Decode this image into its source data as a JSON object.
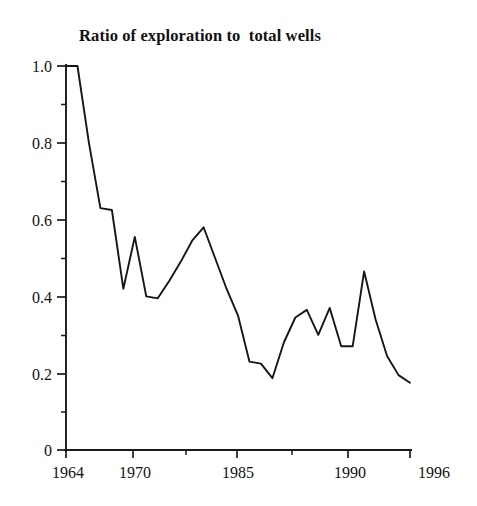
{
  "chart_data": {
    "type": "line",
    "title": "Ratio of exploration to  total wells",
    "xlabel": "",
    "ylabel": "",
    "grid": false,
    "legend": null,
    "xlim": [
      1963,
      1996
    ],
    "ylim": [
      0,
      1.0
    ],
    "y_ticks": [
      "0",
      "0.2",
      "0.4",
      "0.6",
      "0.8",
      "1.0"
    ],
    "y_tick_values": [
      0,
      0.2,
      0.4,
      0.6,
      0.8,
      1.0
    ],
    "y_minor_ticks": [
      0.1,
      0.3,
      0.5,
      0.7,
      0.9
    ],
    "x_ticks": [
      "1964",
      "1970",
      "1985",
      "1990",
      "1996"
    ],
    "x_tick_values": [
      1964,
      1970,
      1985,
      1990,
      1996
    ],
    "x": [
      1963,
      1964,
      1965,
      1966,
      1967,
      1968,
      1969,
      1970,
      1971,
      1972,
      1973,
      1974,
      1975,
      1976,
      1977,
      1978,
      1979,
      1980,
      1981,
      1982,
      1983,
      1984,
      1985,
      1986,
      1987,
      1988,
      1989,
      1990,
      1991,
      1992,
      1993
    ],
    "values": [
      1.0,
      1.0,
      0.8,
      0.63,
      0.625,
      0.42,
      0.555,
      0.4,
      0.395,
      0.44,
      0.49,
      0.545,
      0.58,
      0.5,
      0.42,
      0.35,
      0.23,
      0.225,
      0.187,
      0.28,
      0.345,
      0.365,
      0.3,
      0.37,
      0.27,
      0.27,
      0.465,
      0.34,
      0.245,
      0.195,
      0.175
    ],
    "series_name": "Ratio of exploration to total wells",
    "line_color": "#161616",
    "background_color": "#ffffff",
    "axis_color": "#1a1a1a",
    "annotations": [
      {
        "label": "start plateau at 1.0",
        "x": 1963,
        "y": 1.0
      },
      {
        "label": "sharp peak at 1990",
        "x": 1989,
        "y": 0.465
      },
      {
        "label": "minimum near 1985",
        "x": 1981,
        "y": 0.187
      }
    ]
  }
}
